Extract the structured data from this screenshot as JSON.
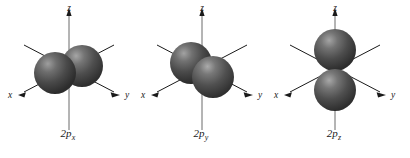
{
  "figure": {
    "background_color": "#ffffff",
    "stroke_color": "#1a1a1a",
    "lobe_color_dark": "#3a3a3a",
    "lobe_color_mid": "#555555",
    "lobe_color_highlight": "#9a9a9a"
  },
  "panels": [
    {
      "id": "2px",
      "label_main": "2p",
      "label_sub": "x",
      "axes": {
        "z": "z",
        "x": "x",
        "y": "y"
      },
      "lobes": 2,
      "orientation": "horizontal-along-x"
    },
    {
      "id": "2py",
      "label_main": "2p",
      "label_sub": "y",
      "axes": {
        "z": "z",
        "x": "x",
        "y": "y"
      },
      "lobes": 2,
      "orientation": "diagonal-along-y"
    },
    {
      "id": "2pz",
      "label_main": "2p",
      "label_sub": "z",
      "axes": {
        "z": "z",
        "x": "x",
        "y": "y"
      },
      "lobes": 2,
      "orientation": "vertical-along-z"
    }
  ]
}
